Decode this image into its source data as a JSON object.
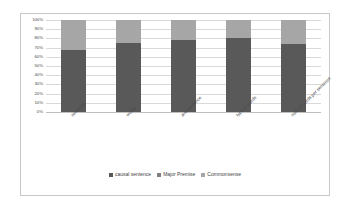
{
  "chart_data": {
    "type": "bar",
    "subtype": "100% stacked bar",
    "title": "",
    "xlabel": "",
    "ylabel": "",
    "ylim": [
      0,
      100
    ],
    "grid": true,
    "legend_position": "bottom",
    "categories": [
      "sentence",
      "words",
      "ave sentence",
      "type of words",
      "num of words per sentence"
    ],
    "ytick_labels": [
      "0%",
      "10%",
      "20%",
      "30%",
      "40%",
      "50%",
      "60%",
      "70%",
      "80%",
      "90%",
      "100%"
    ],
    "ytick_values": [
      0,
      10,
      20,
      30,
      40,
      50,
      60,
      70,
      80,
      90,
      100
    ],
    "series": [
      {
        "name": "causal sentence",
        "color": "#595959",
        "values": [
          67,
          75,
          78,
          80,
          74
        ]
      },
      {
        "name": "Major Premise",
        "color": "#7f7f7f",
        "values": [
          0,
          0,
          0,
          0,
          0
        ]
      },
      {
        "name": "Commonsense",
        "color": "#a6a6a6",
        "values": [
          33,
          25,
          22,
          20,
          26
        ]
      }
    ]
  },
  "colors": {
    "causal_sentence": "#595959",
    "major_premise": "#7f7f7f",
    "commonsense": "#a6a6a6",
    "gridline": "#d9d9d9",
    "border": "#c8c8c8",
    "background": "#ffffff",
    "text": "#4a4a4a"
  },
  "legend": {
    "items": [
      {
        "label": "causal sentence",
        "color": "#595959"
      },
      {
        "label": "Major Premise",
        "color": "#7f7f7f"
      },
      {
        "label": "Commonsense",
        "color": "#a6a6a6"
      }
    ]
  }
}
